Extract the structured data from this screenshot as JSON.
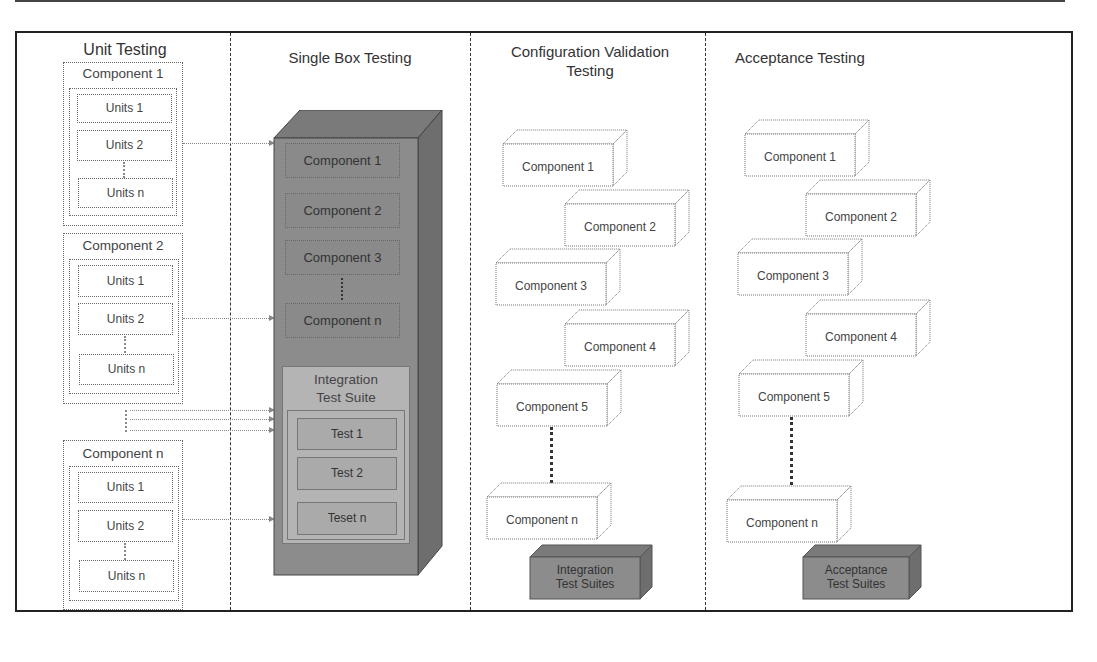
{
  "diagram": {
    "columns": [
      {
        "title": "Unit Testing"
      },
      {
        "title": "Single Box Testing"
      },
      {
        "title": "Configuration Validation Testing",
        "title_line1": "Configuration Validation",
        "title_line2": "Testing"
      },
      {
        "title": "Acceptance Testing"
      }
    ],
    "unit_testing": {
      "components": [
        {
          "name": "Component 1",
          "units": [
            "Units 1",
            "Units 2",
            "Units n"
          ]
        },
        {
          "name": "Component 2",
          "units": [
            "Units 1",
            "Units 2",
            "Units n"
          ]
        },
        {
          "name": "Component n",
          "units": [
            "Units 1",
            "Units 2",
            "Units n"
          ]
        }
      ]
    },
    "single_box": {
      "components": [
        "Component 1",
        "Component 2",
        "Component 3",
        "Component n"
      ],
      "suite_title_line1": "Integration",
      "suite_title_line2": "Test Suite",
      "tests": [
        "Test 1",
        "Test 2",
        "Teset n"
      ]
    },
    "config_validation": {
      "components": [
        "Component 1",
        "Component 2",
        "Component 3",
        "Component 4",
        "Component 5",
        "Component n"
      ],
      "suite_line1": "Integration",
      "suite_line2": "Test Suites"
    },
    "acceptance": {
      "components": [
        "Component 1",
        "Component 2",
        "Component 3",
        "Component 4",
        "Component 5",
        "Component n"
      ],
      "suite_line1": "Acceptance",
      "suite_line2": "Test Suites"
    },
    "colors": {
      "server_front": "#8c8c8c",
      "server_top": "#7a7a7a",
      "server_side": "#6e6e6e",
      "suite_bg": "#b4b4b4",
      "frame": "#222222"
    }
  }
}
